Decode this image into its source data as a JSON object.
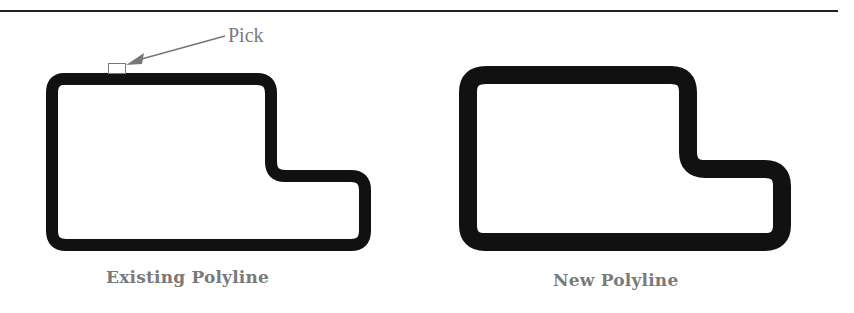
{
  "figure": {
    "top_rule": true,
    "colors": {
      "stroke": "#111111",
      "annotation": "#7a7a7a",
      "background": "#ffffff"
    },
    "left_panel": {
      "caption": "Existing Polyline",
      "stroke_width_px": 12,
      "annotation": {
        "label": "Pick",
        "pick_box": true,
        "arrow": true
      }
    },
    "right_panel": {
      "caption": "New Polyline",
      "stroke_width_px": 18
    }
  }
}
